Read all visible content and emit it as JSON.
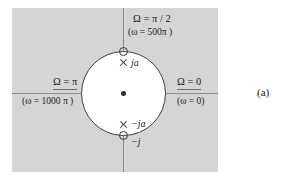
{
  "figure": {
    "caption": "(a)",
    "panel_color": "#d5d5d5",
    "circle_fill": "#ffffff",
    "circle_stroke": "#3f3f3f",
    "axis_color": "#8d8d8d",
    "marker_color": "#3a3a3a"
  },
  "labels": {
    "top": {
      "omega_discrete": "Ω = π / 2",
      "omega_analog": "(ω = 500π )"
    },
    "left": {
      "omega_discrete": "Ω = π",
      "omega_analog": "(ω = 1000 π )"
    },
    "right": {
      "omega_discrete": "Ω = 0",
      "omega_analog": "(ω = 0)"
    },
    "markers": {
      "pole_upper": "ja",
      "pole_lower": "−ja",
      "zero_lower": "−j"
    }
  },
  "chart_data": {
    "type": "scatter",
    "title": "",
    "subtitle": "",
    "xlabel": "Re",
    "ylabel": "Im",
    "xlim": [
      -1.3,
      1.3
    ],
    "ylim": [
      -1.3,
      1.3
    ],
    "grid": false,
    "legend": "none",
    "annotations": [
      {
        "text": "Ω = π / 2",
        "position": "top",
        "angle_rad": 1.5707963
      },
      {
        "text": "(ω = 500π )",
        "position": "top",
        "angle_rad": 1.5707963
      },
      {
        "text": "Ω = π",
        "position": "left",
        "angle_rad": 3.1415927
      },
      {
        "text": "(ω = 1000 π )",
        "position": "left",
        "angle_rad": 3.1415927
      },
      {
        "text": "Ω = 0",
        "position": "right",
        "angle_rad": 0
      },
      {
        "text": "(ω = 0)",
        "position": "right",
        "angle_rad": 0
      }
    ],
    "series": [
      {
        "name": "zeros",
        "marker": "circle",
        "x": [
          0,
          0
        ],
        "y": [
          1,
          -1
        ],
        "point_labels": [
          "",
          "−j"
        ]
      },
      {
        "name": "poles",
        "marker": "x",
        "x": [
          0,
          0
        ],
        "y": [
          0.74,
          -0.74
        ],
        "point_labels": [
          "ja",
          "−ja"
        ]
      },
      {
        "name": "unit-circle",
        "marker": "none",
        "radius": 1,
        "center": [
          0,
          0
        ]
      }
    ]
  }
}
